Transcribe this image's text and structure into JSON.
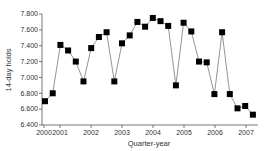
{
  "chart_data": {
    "type": "line",
    "title": "",
    "xlabel": "Quarter-year",
    "ylabel": "14-day holds",
    "ylim": [
      6.4,
      7.8
    ],
    "yticks": [
      "6.400",
      "6.600",
      "6.800",
      "7.000",
      "7.200",
      "7.400",
      "7.600",
      "7.800"
    ],
    "xtick_labels": [
      "2000",
      "2001",
      "2002",
      "2003",
      "2004",
      "2005",
      "2006",
      "2007"
    ],
    "grid": false,
    "legend": null,
    "marker": "square",
    "color": "#000000",
    "x": [
      "2000 Q3",
      "2000 Q4",
      "2001 Q1",
      "2001 Q2",
      "2001 Q3",
      "2001 Q4",
      "2002 Q1",
      "2002 Q2",
      "2002 Q3",
      "2002 Q4",
      "2003 Q1",
      "2003 Q2",
      "2003 Q3",
      "2003 Q4",
      "2004 Q1",
      "2004 Q2",
      "2004 Q3",
      "2004 Q4",
      "2005 Q1",
      "2005 Q2",
      "2005 Q3",
      "2005 Q4",
      "2006 Q1",
      "2006 Q2",
      "2006 Q3",
      "2006 Q4",
      "2007 Q1",
      "2007 Q2"
    ],
    "values": [
      6.7,
      6.8,
      7.41,
      7.34,
      7.2,
      6.95,
      7.37,
      7.51,
      7.57,
      6.95,
      7.43,
      7.53,
      7.7,
      7.64,
      7.75,
      7.71,
      7.65,
      6.9,
      7.69,
      7.58,
      7.2,
      7.19,
      6.79,
      7.57,
      6.79,
      6.61,
      6.64,
      6.53
    ]
  }
}
